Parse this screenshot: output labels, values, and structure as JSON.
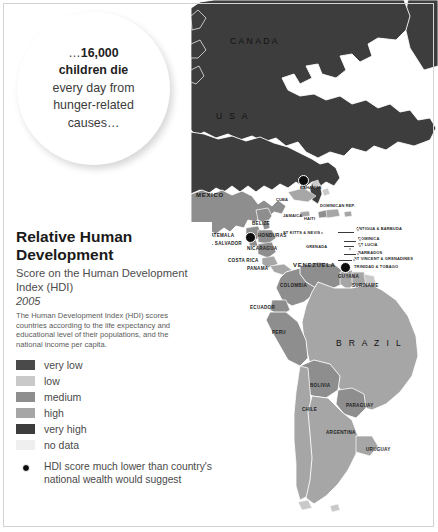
{
  "bubble": {
    "line1_prefix": "…",
    "line1_bold": "16,000",
    "line2_bold": "children die",
    "line3": "every day from",
    "line4": "hunger-related",
    "line5": "causes…",
    "full_text": "…16,000 children die every day from hunger-related causes…"
  },
  "panel": {
    "title": "Relative Human Development",
    "subtitle": "Score on the Human Development Index (HDI)",
    "year": "2005",
    "blurb": "The Human Development Index (HDI) scores countries according to the life expectancy and educational level of their populations, and the national income per capita.",
    "legend": [
      {
        "label": "very low",
        "color": "#4a4a4a"
      },
      {
        "label": "low",
        "color": "#c9c9c9"
      },
      {
        "label": "medium",
        "color": "#8e8e8e"
      },
      {
        "label": "high",
        "color": "#a6a6a6"
      },
      {
        "label": "very high",
        "color": "#3d3d3d"
      },
      {
        "label": "no data",
        "color": "#efefef"
      }
    ],
    "note": "HDI score much lower than country's national wealth would suggest",
    "note_marker": "black-dot"
  },
  "map": {
    "background": "#ffffff",
    "ocean": "#ffffff",
    "colors": {
      "very_high": "#3d3d3d",
      "high": "#a6a6a6",
      "medium": "#8e8e8e",
      "low": "#c9c9c9",
      "very_low": "#4a4a4a",
      "no_data": "#efefef",
      "border": "#ffffff"
    },
    "labels": [
      {
        "name": "CANADA",
        "x": 252,
        "y": 42,
        "size": "big"
      },
      {
        "name": "U S A",
        "x": 236,
        "y": 117,
        "size": "big"
      },
      {
        "name": "MEXICO",
        "x": 196,
        "y": 196,
        "size": "mid"
      },
      {
        "name": "BELIZE",
        "x": 252,
        "y": 224,
        "size": "sm"
      },
      {
        "name": "GUATEMALA",
        "x": 203,
        "y": 236,
        "size": "sm"
      },
      {
        "name": "HONDURAS",
        "x": 258,
        "y": 236,
        "size": "sm"
      },
      {
        "name": "EL SALVADOR",
        "x": 207,
        "y": 244,
        "size": "sm"
      },
      {
        "name": "NICARAGUA",
        "x": 247,
        "y": 249,
        "size": "sm"
      },
      {
        "name": "COSTA RICA",
        "x": 228,
        "y": 261,
        "size": "sm"
      },
      {
        "name": "PANAMA",
        "x": 247,
        "y": 269,
        "size": "sm"
      },
      {
        "name": "CUBA",
        "x": 276,
        "y": 200,
        "size": "xs"
      },
      {
        "name": "BAHAMAS",
        "x": 300,
        "y": 188,
        "size": "xs"
      },
      {
        "name": "JAMAICA",
        "x": 283,
        "y": 216,
        "size": "xs"
      },
      {
        "name": "HAITI",
        "x": 304,
        "y": 219,
        "size": "xs"
      },
      {
        "name": "DOMINICAN REP.",
        "x": 320,
        "y": 209,
        "size": "xs"
      },
      {
        "name": "ST KITTS & NEVIS",
        "x": 327,
        "y": 233,
        "size": "xs"
      },
      {
        "name": "ANTIGUA & BARBUDA",
        "x": 381,
        "y": 229,
        "size": "xs"
      },
      {
        "name": "DOMINICA",
        "x": 381,
        "y": 239,
        "size": "xs"
      },
      {
        "name": "GRENADA",
        "x": 328,
        "y": 246,
        "size": "xs"
      },
      {
        "name": "ST LUCIA",
        "x": 376,
        "y": 244,
        "size": "xs"
      },
      {
        "name": "BARBADOS",
        "x": 381,
        "y": 252,
        "size": "xs"
      },
      {
        "name": "ST VINCENT & GRENADINES",
        "x": 352,
        "y": 258,
        "size": "xs"
      },
      {
        "name": "TRINIDAD & TOBAGO",
        "x": 356,
        "y": 266,
        "size": "xs"
      },
      {
        "name": "VENEZUELA",
        "x": 307,
        "y": 265,
        "size": "mid"
      },
      {
        "name": "GUYANA",
        "x": 345,
        "y": 276,
        "size": "sm"
      },
      {
        "name": "SURINAME",
        "x": 359,
        "y": 285,
        "size": "sm"
      },
      {
        "name": "COLOMBIA",
        "x": 286,
        "y": 285,
        "size": "sm"
      },
      {
        "name": "ECUADOR",
        "x": 256,
        "y": 307,
        "size": "sm"
      },
      {
        "name": "PERU",
        "x": 277,
        "y": 332,
        "size": "sm"
      },
      {
        "name": "B R A Z I L",
        "x": 355,
        "y": 344,
        "size": "big"
      },
      {
        "name": "BOLIVIA",
        "x": 316,
        "y": 385,
        "size": "sm"
      },
      {
        "name": "PARAGUAY",
        "x": 352,
        "y": 405,
        "size": "sm"
      },
      {
        "name": "CHILE",
        "x": 308,
        "y": 409,
        "size": "sm"
      },
      {
        "name": "ARGENTINA",
        "x": 335,
        "y": 432,
        "size": "sm"
      },
      {
        "name": "URUGUAY",
        "x": 374,
        "y": 449,
        "size": "sm"
      }
    ],
    "marked_countries": [
      {
        "name": "Cuba",
        "x": 303,
        "y": 180
      },
      {
        "name": "Guatemala",
        "x": 250,
        "y": 237
      },
      {
        "name": "Trinidad & Tobago",
        "x": 345,
        "y": 267
      }
    ]
  }
}
